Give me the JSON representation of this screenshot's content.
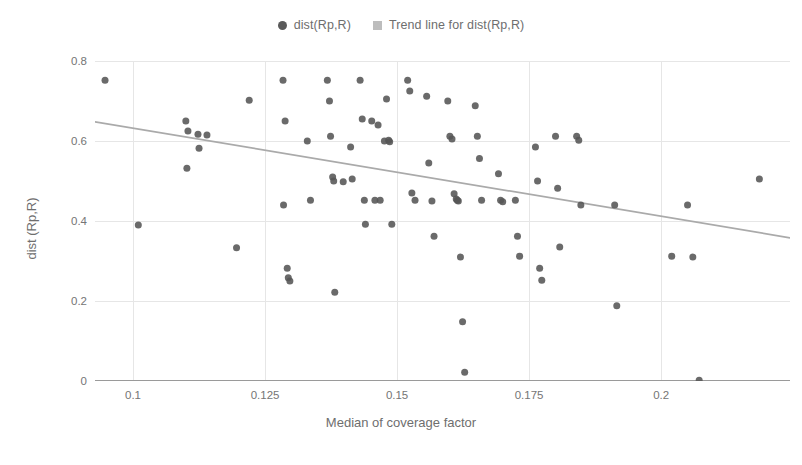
{
  "legend": {
    "position": "top-center",
    "entries": [
      {
        "label": "dist(Rp,R)",
        "marker": "circle-dot-icon",
        "color": "#5a5a5a"
      },
      {
        "label": "Trend line for dist(Rp,R)",
        "marker": "square-swatch-icon",
        "color": "#bdbdbd"
      }
    ]
  },
  "axes": {
    "x": {
      "label": "Median of coverage factor",
      "ticks": [
        "0.1",
        "0.125",
        "0.15",
        "0.175",
        "0.2"
      ],
      "tick_values": [
        0.1,
        0.125,
        0.15,
        0.175,
        0.2
      ],
      "range": [
        0.0928,
        0.2244
      ]
    },
    "y": {
      "label": "dist (Rp,R)",
      "ticks": [
        "0",
        "0.2",
        "0.4",
        "0.6",
        "0.8"
      ],
      "tick_values": [
        0,
        0.2,
        0.4,
        0.6,
        0.8
      ],
      "range": [
        0,
        0.8
      ]
    }
  },
  "style": {
    "grid": true,
    "grid_color": "#e6e6e6",
    "axis_line_color": "#9a9a9a",
    "marker_color": "#555555",
    "marker_size_px": 7,
    "trend_color": "#aaaaaa",
    "background": "#ffffff"
  },
  "chart_data": {
    "type": "scatter",
    "title": "",
    "xlabel": "Median of coverage factor",
    "ylabel": "dist (Rp,R)",
    "xlim": [
      0.0928,
      0.2244
    ],
    "ylim": [
      0,
      0.8
    ],
    "grid": true,
    "legend": [
      "dist(Rp,R)",
      "Trend line for dist(Rp,R)"
    ],
    "series": [
      {
        "name": "dist(Rp,R)",
        "type": "scatter",
        "points": [
          [
            0.0947,
            0.752
          ],
          [
            0.101,
            0.39
          ],
          [
            0.11,
            0.65
          ],
          [
            0.1104,
            0.625
          ],
          [
            0.1102,
            0.532
          ],
          [
            0.1123,
            0.617
          ],
          [
            0.1125,
            0.582
          ],
          [
            0.114,
            0.615
          ],
          [
            0.1196,
            0.333
          ],
          [
            0.122,
            0.702
          ],
          [
            0.1284,
            0.752
          ],
          [
            0.1288,
            0.65
          ],
          [
            0.1285,
            0.44
          ],
          [
            0.1292,
            0.282
          ],
          [
            0.1294,
            0.258
          ],
          [
            0.1297,
            0.25
          ],
          [
            0.133,
            0.6
          ],
          [
            0.1336,
            0.452
          ],
          [
            0.1368,
            0.752
          ],
          [
            0.1372,
            0.7
          ],
          [
            0.1374,
            0.612
          ],
          [
            0.1378,
            0.51
          ],
          [
            0.138,
            0.5
          ],
          [
            0.1382,
            0.222
          ],
          [
            0.1398,
            0.498
          ],
          [
            0.1412,
            0.585
          ],
          [
            0.1415,
            0.505
          ],
          [
            0.143,
            0.752
          ],
          [
            0.1434,
            0.655
          ],
          [
            0.1438,
            0.452
          ],
          [
            0.144,
            0.392
          ],
          [
            0.1452,
            0.65
          ],
          [
            0.1458,
            0.452
          ],
          [
            0.1464,
            0.64
          ],
          [
            0.1468,
            0.452
          ],
          [
            0.1476,
            0.6
          ],
          [
            0.148,
            0.705
          ],
          [
            0.1484,
            0.602
          ],
          [
            0.1486,
            0.598
          ],
          [
            0.149,
            0.392
          ],
          [
            0.152,
            0.752
          ],
          [
            0.1524,
            0.725
          ],
          [
            0.1528,
            0.47
          ],
          [
            0.1534,
            0.452
          ],
          [
            0.1556,
            0.712
          ],
          [
            0.156,
            0.545
          ],
          [
            0.1566,
            0.45
          ],
          [
            0.157,
            0.362
          ],
          [
            0.1596,
            0.7
          ],
          [
            0.16,
            0.612
          ],
          [
            0.1604,
            0.605
          ],
          [
            0.1608,
            0.468
          ],
          [
            0.1612,
            0.455
          ],
          [
            0.1614,
            0.452
          ],
          [
            0.1616,
            0.45
          ],
          [
            0.162,
            0.31
          ],
          [
            0.1624,
            0.148
          ],
          [
            0.1628,
            0.022
          ],
          [
            0.1648,
            0.688
          ],
          [
            0.1652,
            0.612
          ],
          [
            0.1656,
            0.556
          ],
          [
            0.166,
            0.452
          ],
          [
            0.1692,
            0.518
          ],
          [
            0.1696,
            0.452
          ],
          [
            0.17,
            0.448
          ],
          [
            0.1724,
            0.452
          ],
          [
            0.1728,
            0.362
          ],
          [
            0.1732,
            0.312
          ],
          [
            0.1762,
            0.585
          ],
          [
            0.1766,
            0.5
          ],
          [
            0.177,
            0.282
          ],
          [
            0.1774,
            0.252
          ],
          [
            0.18,
            0.612
          ],
          [
            0.1804,
            0.482
          ],
          [
            0.1808,
            0.335
          ],
          [
            0.184,
            0.612
          ],
          [
            0.1844,
            0.602
          ],
          [
            0.1848,
            0.44
          ],
          [
            0.1912,
            0.44
          ],
          [
            0.1916,
            0.188
          ],
          [
            0.202,
            0.312
          ],
          [
            0.205,
            0.44
          ],
          [
            0.206,
            0.31
          ],
          [
            0.2072,
            0.002
          ],
          [
            0.2186,
            0.505
          ]
        ]
      },
      {
        "name": "Trend line for dist(Rp,R)",
        "type": "line",
        "points": [
          [
            0.0928,
            0.648
          ],
          [
            0.2244,
            0.358
          ]
        ],
        "slope": -2.203,
        "intercept": 0.853
      }
    ]
  }
}
